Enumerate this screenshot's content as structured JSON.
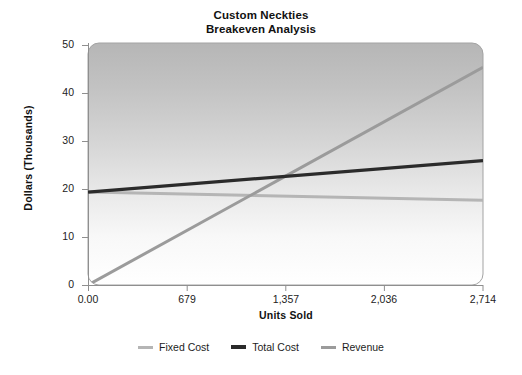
{
  "chart_data": {
    "type": "line",
    "title": "Custom Neckties",
    "subtitle": "Breakeven Analysis",
    "xlabel": "Units Sold",
    "ylabel": "Dollars (Thousands)",
    "xlim": [
      0,
      2714
    ],
    "ylim": [
      0,
      50
    ],
    "xticks": [
      0,
      679,
      1357,
      2036,
      2714
    ],
    "xticklabels": [
      "0.00",
      "679",
      "1,357",
      "2,036",
      "2,714"
    ],
    "yticks": [
      0,
      10,
      20,
      30,
      40,
      50
    ],
    "yticklabels": [
      "0",
      "10",
      "20",
      "30",
      "40",
      "50"
    ],
    "grid": false,
    "legend_position": "bottom",
    "x": [
      0,
      2714
    ],
    "series": [
      {
        "name": "Fixed Cost",
        "values": [
          19.2,
          17.5
        ],
        "color": "#b5b5b5"
      },
      {
        "name": "Total Cost",
        "values": [
          19.2,
          25.7
        ],
        "color": "#2b2b2b"
      },
      {
        "name": "Revenue",
        "values": [
          0,
          45.0
        ],
        "color": "#9b9b9b"
      }
    ],
    "annotations": [],
    "plot_background": {
      "gradient_top": "#b9b9b9",
      "gradient_bottom": "#fcfcfc",
      "border": "#9a9a9a"
    }
  },
  "axis": {
    "y_title": "Dollars (Thousands)",
    "x_title": "Units Sold",
    "y_tick_labels": [
      "50",
      "40",
      "30",
      "20",
      "10",
      "0"
    ],
    "x_tick_labels": [
      "0.00",
      "679",
      "1,357",
      "2,036",
      "2,714"
    ]
  },
  "legend": {
    "items": [
      {
        "label": "Fixed Cost",
        "color": "#b5b5b5"
      },
      {
        "label": "Total Cost",
        "color": "#2b2b2b"
      },
      {
        "label": "Revenue",
        "color": "#9b9b9b"
      }
    ]
  }
}
